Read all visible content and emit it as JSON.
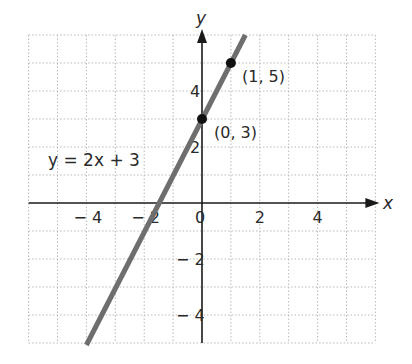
{
  "chart_data": {
    "type": "line",
    "title": "",
    "xlabel": "x",
    "ylabel": "y",
    "xlim": [
      -6,
      6
    ],
    "ylim": [
      -5,
      6
    ],
    "grid": true,
    "grid_step": 1,
    "x_ticks": [
      -4,
      -2,
      0,
      2,
      4
    ],
    "x_tick_labels": [
      "− 4",
      "− 2",
      "0",
      "2",
      "4"
    ],
    "y_ticks": [
      -4,
      -2,
      2,
      4
    ],
    "y_tick_labels": [
      "− 4",
      "− 2",
      "2",
      "4"
    ],
    "series": [
      {
        "name": "y = 2x + 3",
        "equation": "y = 2x + 3",
        "slope": 2,
        "intercept": 3,
        "x": [
          -4,
          1.5
        ],
        "y": [
          -5,
          6
        ],
        "color": "#6e6e6e"
      }
    ],
    "points": [
      {
        "x": 0,
        "y": 3,
        "label": "(0,  3)"
      },
      {
        "x": 1,
        "y": 5,
        "label": "(1,  5)"
      }
    ],
    "annotations": [
      {
        "text": "y  =  2x  +  3",
        "x": -5.4,
        "y": 1.3
      }
    ]
  },
  "labels": {
    "x_axis": "x",
    "y_axis": "y",
    "equation": "y  =  2x  +  3",
    "point_a": "(0,  3)",
    "point_b": "(1,  5)",
    "origin": "0"
  }
}
